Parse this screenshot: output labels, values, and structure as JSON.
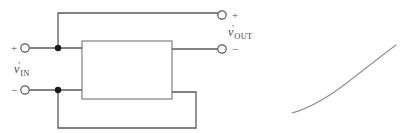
{
  "figure": {
    "type": "circuit-diagram",
    "background_color": "#ffffff",
    "wire_color": "#5a5a5a",
    "box_border_color": "#8a8a8a",
    "text_color": "#4a4a4a",
    "curve_color": "#8d8d8d"
  },
  "input_port": {
    "plus_sign": "+",
    "minus_sign": "−",
    "label_symbol": "v",
    "label_prime": "′",
    "label_subscript": "IN"
  },
  "output_port": {
    "plus_sign": "+",
    "minus_sign": "−",
    "label_symbol": "v",
    "label_prime": "′",
    "label_subscript": "OUT"
  },
  "amplifier_block": {
    "label": "",
    "x": 82,
    "y": 41,
    "width": 90,
    "height": 58
  },
  "terminals": [
    {
      "name": "input-plus",
      "cx": 25,
      "cy": 48,
      "r": 4.2
    },
    {
      "name": "input-minus",
      "cx": 25,
      "cy": 90,
      "r": 4.2
    },
    {
      "name": "output-plus",
      "cx": 222,
      "cy": 15,
      "r": 4.2
    },
    {
      "name": "output-minus",
      "cx": 222,
      "cy": 49,
      "r": 4.2
    }
  ],
  "junctions": [
    {
      "name": "top-feedback-node",
      "cx": 58,
      "cy": 48,
      "r": 3.2
    },
    {
      "name": "bottom-feedback-node",
      "cx": 58,
      "cy": 90,
      "r": 3.2
    }
  ],
  "wires": {
    "input_plus_lead": "M29.2,48 L82,48",
    "input_minus_lead": "M29.2,90 L82,90",
    "output_plus_lead": "M58,48 L58,13 L217.8,13",
    "output_minus_lead": "M172,49 L217.8,49",
    "feedback_path": "M172,92 L196,92 L196,128 L58,128 L58,90"
  },
  "transfer_curve": {
    "description": "S-shaped transfer characteristic curve",
    "path": "M292,113 C 310,108 330,96 348,82 C 366,68 384,54 396,45",
    "start_point": [
      292,
      113
    ],
    "end_point": [
      396,
      45
    ]
  }
}
